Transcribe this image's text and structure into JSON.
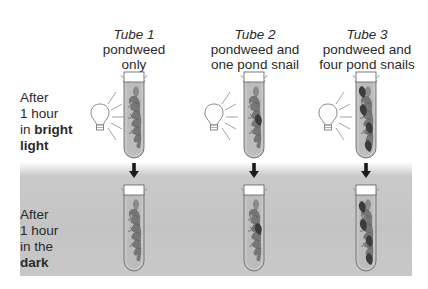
{
  "tubes": [
    {
      "title": "Tube 1",
      "line1": "pondweed",
      "line2": "only",
      "snails": 0
    },
    {
      "title": "Tube 2",
      "line1": "pondweed and",
      "line2": "one pond snail",
      "snails": 1
    },
    {
      "title": "Tube 3",
      "line1": "pondweed and",
      "line2": "four pond snails",
      "snails": 4
    }
  ],
  "rows": {
    "light": {
      "line1": "After",
      "line2": "1 hour",
      "line3_prefix": "in ",
      "line3_bold": "bright",
      "line4_bold": "light"
    },
    "dark": {
      "line1": "After",
      "line2": "1 hour",
      "line3": "in the",
      "line4_bold": "dark"
    }
  },
  "icons": {
    "light_source": "light-bulb-icon",
    "transition": "down-arrow-icon"
  },
  "colors": {
    "dark_band": "#c6c6c6",
    "tube_fill": "#b9b9b9",
    "pondweed": "#6e6e6e",
    "snail": "#3c3c3c",
    "arrow": "#1a1a1a"
  }
}
